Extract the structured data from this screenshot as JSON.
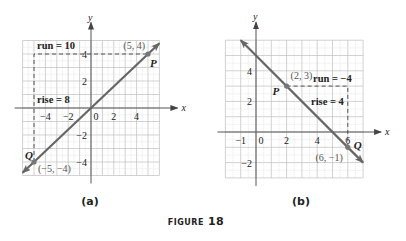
{
  "figure": {
    "caption_word": "FIGURE",
    "caption_number": "18"
  },
  "colors": {
    "line": "#666666",
    "grid": "#c8c8c8",
    "axis": "#555555",
    "text": "#222222",
    "point_label": "#555555"
  },
  "panels": [
    {
      "id": "a",
      "label": "(a)",
      "x_axis_label": "x",
      "y_axis_label": "y",
      "origin_px": [
        91,
        108
      ],
      "unit_px": [
        11.4,
        13.5
      ],
      "grid_range": {
        "xmin": -6,
        "xmax": 6,
        "ymin": -5,
        "ymax": 5
      },
      "x_ticks": [
        -4,
        -2,
        0,
        2,
        4
      ],
      "y_ticks": [
        4,
        2,
        -2,
        -4
      ],
      "points": [
        {
          "name": "P",
          "coord": [
            5,
            4
          ],
          "label": "(5, 4)"
        },
        {
          "name": "Q",
          "coord": [
            -5,
            -4
          ],
          "label": "(−5, −4)"
        }
      ],
      "line": {
        "from": [
          -6,
          -4.8
        ],
        "to": [
          6,
          4.8
        ]
      },
      "annotations": {
        "run": "run = 10",
        "rise": "rise = 8"
      }
    },
    {
      "id": "b",
      "label": "(b)",
      "x_axis_label": "x",
      "y_axis_label": "y",
      "origin_px": [
        256,
        132
      ],
      "unit_px": [
        15.3,
        15.3
      ],
      "grid_range": {
        "xmin": -2,
        "xmax": 7,
        "ymin": -3,
        "ymax": 6
      },
      "x_ticks": [
        -1,
        0,
        2,
        4,
        6
      ],
      "y_ticks": [
        4,
        2,
        -2
      ],
      "points": [
        {
          "name": "P",
          "coord": [
            2,
            3
          ],
          "label": "(2, 3)"
        },
        {
          "name": "Q",
          "coord": [
            6,
            -1
          ],
          "label": "(6, −1)"
        }
      ],
      "line": {
        "from": [
          -1,
          6
        ],
        "to": [
          7,
          -2
        ]
      },
      "annotations": {
        "run": "run = −4",
        "rise": "rise = 4"
      }
    }
  ],
  "chart_data": [
    {
      "type": "line",
      "title": "(a)",
      "xlabel": "x",
      "ylabel": "y",
      "points": [
        {
          "name": "P",
          "x": 5,
          "y": 4
        },
        {
          "name": "Q",
          "x": -5,
          "y": -4
        }
      ],
      "run": 10,
      "rise": 8,
      "xlim": [
        -6,
        6
      ],
      "ylim": [
        -5,
        5
      ],
      "grid": true
    },
    {
      "type": "line",
      "title": "(b)",
      "xlabel": "x",
      "ylabel": "y",
      "points": [
        {
          "name": "P",
          "x": 2,
          "y": 3
        },
        {
          "name": "Q",
          "x": 6,
          "y": -1
        }
      ],
      "run": -4,
      "rise": 4,
      "xlim": [
        -2,
        7
      ],
      "ylim": [
        -3,
        6
      ],
      "grid": true
    }
  ]
}
